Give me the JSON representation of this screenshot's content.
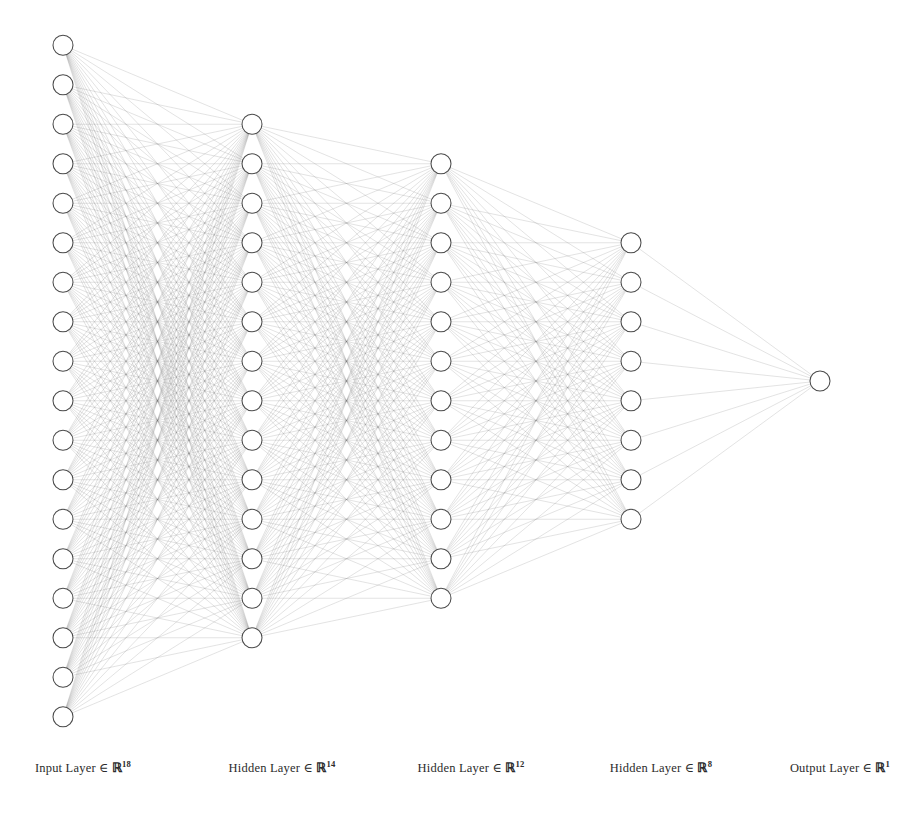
{
  "figure": {
    "title": "",
    "background_color": "#ffffff",
    "node_fill": "#ffffff",
    "node_stroke": "#4a4a4a",
    "edge_color": "#6f6f6f"
  },
  "chart_data": {
    "type": "diagram",
    "diagram_type": "neural-network-architecture",
    "title": "",
    "node_radius": 10,
    "node_spacing": 39.5,
    "center_y": 381,
    "layers": [
      {
        "name": "Input Layer",
        "symbol": "∈",
        "space": "ℝ",
        "dimension": 18,
        "units": 18,
        "label": "Input Layer ∈ ℝ¹⁸",
        "label_text": "Input Layer",
        "exponent": "18",
        "x": 63,
        "label_x": 83
      },
      {
        "name": "Hidden Layer",
        "symbol": "∈",
        "space": "ℝ",
        "dimension": 14,
        "units": 14,
        "label": "Hidden Layer ∈ ℝ¹⁴",
        "label_text": "Hidden Layer",
        "exponent": "14",
        "x": 252,
        "label_x": 282
      },
      {
        "name": "Hidden Layer",
        "symbol": "∈",
        "space": "ℝ",
        "dimension": 12,
        "units": 12,
        "label": "Hidden Layer ∈ ℝ¹²",
        "label_text": "Hidden Layer",
        "exponent": "12",
        "x": 441,
        "label_x": 471
      },
      {
        "name": "Hidden Layer",
        "symbol": "∈",
        "space": "ℝ",
        "dimension": 8,
        "units": 8,
        "label": "Hidden Layer ∈ ℝ⁸",
        "label_text": "Hidden Layer",
        "exponent": "8",
        "x": 631,
        "label_x": 661
      },
      {
        "name": "Output Layer",
        "symbol": "∈",
        "space": "ℝ",
        "dimension": 1,
        "units": 1,
        "label": "Output Layer ∈ ℝ¹",
        "label_text": "Output Layer",
        "exponent": "1",
        "x": 820,
        "label_x": 840
      }
    ],
    "connections": "fully-connected",
    "label_y": 772,
    "total_nodes": 53,
    "total_edges": 600
  }
}
